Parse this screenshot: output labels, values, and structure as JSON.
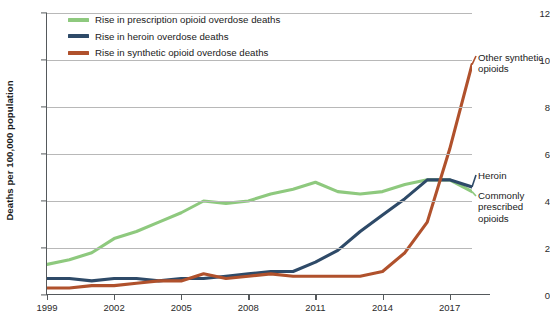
{
  "chart_data": {
    "type": "line",
    "title": "",
    "xlabel": "",
    "ylabel": "Deaths per 100,000 population",
    "xlim": [
      1999,
      2018
    ],
    "ylim": [
      0,
      12
    ],
    "grid": true,
    "legend_position": "top-left",
    "xticks": [
      "1999",
      "2002",
      "2005",
      "2008",
      "2011",
      "2014",
      "2017"
    ],
    "xtick_values": [
      1999,
      2002,
      2005,
      2008,
      2011,
      2014,
      2017
    ],
    "yticks": [
      "0",
      "2",
      "4",
      "6",
      "8",
      "10",
      "12"
    ],
    "ytick_values": [
      0,
      2,
      4,
      6,
      8,
      10,
      12
    ],
    "x": [
      1999,
      2000,
      2001,
      2002,
      2003,
      2004,
      2005,
      2006,
      2007,
      2008,
      2009,
      2010,
      2011,
      2012,
      2013,
      2014,
      2015,
      2016,
      2017,
      2018
    ],
    "series": [
      {
        "name": "Rise in prescription opioid overdose deaths",
        "annotation": "Commonly prescribed opioids",
        "color": "#8ec97e",
        "values": [
          1.3,
          1.5,
          1.8,
          2.4,
          2.7,
          3.1,
          3.5,
          4.0,
          3.9,
          4.0,
          4.3,
          4.5,
          4.8,
          4.4,
          4.3,
          4.4,
          4.7,
          4.9,
          4.9,
          4.4
        ]
      },
      {
        "name": "Rise in heroin overdose deaths",
        "annotation": "Heroin",
        "color": "#2e4a68",
        "values": [
          0.7,
          0.7,
          0.6,
          0.7,
          0.7,
          0.6,
          0.7,
          0.7,
          0.8,
          0.9,
          1.0,
          1.0,
          1.4,
          1.9,
          2.7,
          3.4,
          4.1,
          4.9,
          4.9,
          4.6
        ]
      },
      {
        "name": "Rise in synthetic opioid overdose deaths",
        "annotation": "Other synthetic opioids",
        "color": "#b0512c",
        "values": [
          0.3,
          0.3,
          0.4,
          0.4,
          0.5,
          0.6,
          0.6,
          0.9,
          0.7,
          0.8,
          0.9,
          0.8,
          0.8,
          0.8,
          0.8,
          1.0,
          1.8,
          3.1,
          6.2,
          9.8
        ]
      }
    ]
  },
  "legend": {
    "items": [
      {
        "label": "Rise in prescription opioid overdose deaths",
        "color": "#8ec97e"
      },
      {
        "label": "Rise in heroin overdose deaths",
        "color": "#2e4a68"
      },
      {
        "label": "Rise in synthetic opioid overdose deaths",
        "color": "#b0512c"
      }
    ]
  },
  "annotations": {
    "other_synthetic": "Other synthetic opioids",
    "heroin": "Heroin",
    "commonly_prescribed": "Commonly prescribed opioids"
  }
}
